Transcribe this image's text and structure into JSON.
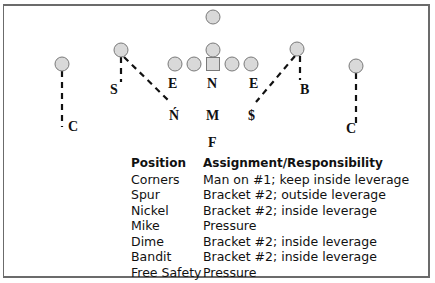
{
  "diagram": {
    "offense_players": [
      {
        "id": "qb-deep",
        "shape": "circle",
        "cx": 213,
        "cy": 17
      },
      {
        "id": "back",
        "shape": "circle",
        "cx": 213,
        "cy": 50
      },
      {
        "id": "lt",
        "shape": "circle",
        "cx": 175,
        "cy": 64
      },
      {
        "id": "lg",
        "shape": "circle",
        "cx": 194,
        "cy": 64
      },
      {
        "id": "center",
        "shape": "square",
        "cx": 213,
        "cy": 64
      },
      {
        "id": "rg",
        "shape": "circle",
        "cx": 232,
        "cy": 64
      },
      {
        "id": "rt",
        "shape": "circle",
        "cx": 251,
        "cy": 64
      },
      {
        "id": "wr-left-out",
        "shape": "circle",
        "cx": 62,
        "cy": 64
      },
      {
        "id": "wr-left-slot",
        "shape": "circle",
        "cx": 121,
        "cy": 50
      },
      {
        "id": "wr-right-slot",
        "shape": "circle",
        "cx": 297,
        "cy": 49
      },
      {
        "id": "wr-right-out",
        "shape": "circle",
        "cx": 356,
        "cy": 66
      }
    ],
    "defense_labels": [
      {
        "id": "c-left",
        "text": "C",
        "x": 68,
        "y": 120
      },
      {
        "id": "s-left",
        "text": "S",
        "x": 110,
        "y": 83
      },
      {
        "id": "e-left",
        "text": "E",
        "x": 168,
        "y": 77
      },
      {
        "id": "n-nose",
        "text": "N",
        "x": 207,
        "y": 77
      },
      {
        "id": "e-right",
        "text": "E",
        "x": 249,
        "y": 77
      },
      {
        "id": "b-right",
        "text": "B",
        "x": 300,
        "y": 83
      },
      {
        "id": "n-nickel",
        "text": "Ń",
        "x": 169,
        "y": 109
      },
      {
        "id": "m-mike",
        "text": "M",
        "x": 206,
        "y": 109
      },
      {
        "id": "s-dime",
        "text": "$",
        "x": 248,
        "y": 109
      },
      {
        "id": "c-right",
        "text": "C",
        "x": 346,
        "y": 122
      },
      {
        "id": "f-free",
        "text": "F",
        "x": 208,
        "y": 136
      }
    ],
    "routes": [
      {
        "id": "c-left-route",
        "x1": 62,
        "y1": 71,
        "x2": 62,
        "y2": 127
      },
      {
        "id": "s-left-route",
        "x1": 121,
        "y1": 57,
        "x2": 121,
        "y2": 82
      },
      {
        "id": "n-route",
        "x1": 124,
        "y1": 57,
        "x2": 170,
        "y2": 102
      },
      {
        "id": "b-route",
        "x1": 300,
        "y1": 56,
        "x2": 300,
        "y2": 80
      },
      {
        "id": "s-right-route",
        "x1": 295,
        "y1": 56,
        "x2": 256,
        "y2": 102
      },
      {
        "id": "c-right-route",
        "x1": 356,
        "y1": 73,
        "x2": 356,
        "y2": 126
      }
    ],
    "colors": {
      "player_fill": "#d9d9d9",
      "player_stroke": "#7a7a7a",
      "route": "#111111",
      "frame": "#6b6b6b"
    }
  },
  "table": {
    "headers": {
      "position": "Position",
      "assignment": "Assignment/Responsibility"
    },
    "rows": [
      {
        "position": "Corners",
        "assignment": "Man on #1; keep inside leverage"
      },
      {
        "position": "Spur",
        "assignment": "Bracket #2; outside leverage"
      },
      {
        "position": "Nickel",
        "assignment": "Bracket #2; inside leverage"
      },
      {
        "position": "Mike",
        "assignment": "Pressure"
      },
      {
        "position": "Dime",
        "assignment": "Bracket #2; inside leverage"
      },
      {
        "position": "Bandit",
        "assignment": "Bracket #2; inside leverage"
      },
      {
        "position": "Free Safety",
        "assignment": "Pressure"
      }
    ]
  }
}
